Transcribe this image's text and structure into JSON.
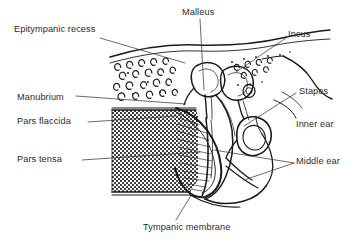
{
  "figure": {
    "style": "black and white line drawing",
    "background_color": "#ffffff",
    "ink_color": "#1a1a1a",
    "text_color": "#2b2b2b"
  },
  "labels": {
    "epitympanic_recess": "Epitympanic recess",
    "manubrium": "Manubrium",
    "pars_flaccida": "Pars flaccida",
    "pars_tensa": "Pars tensa",
    "malleus": "Malleus",
    "incus": "Incus",
    "stapes": "Stapes",
    "inner_ear": "Inner ear",
    "middle_ear": "Middle ear",
    "tympanic_membrane": "Tympanic membrane"
  }
}
